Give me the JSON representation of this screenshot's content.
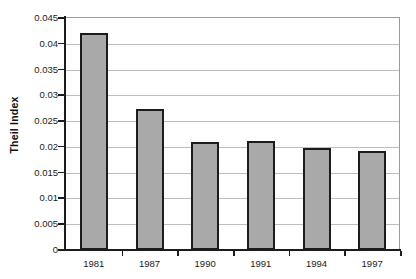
{
  "chart_data": {
    "type": "bar",
    "title": "",
    "subtitle": "",
    "xlabel": "",
    "ylabel": "Theil Index",
    "categories": [
      "1981",
      "1987",
      "1990",
      "1991",
      "1994",
      "1997"
    ],
    "values": [
      0.0421,
      0.0273,
      0.021,
      0.0211,
      0.0198,
      0.0192
    ],
    "series": [
      {
        "name": "Theil Index",
        "values": [
          0.0421,
          0.0273,
          0.021,
          0.0211,
          0.0198,
          0.0192
        ]
      }
    ],
    "ylim": [
      0,
      0.045
    ],
    "ytick_labels": [
      "0",
      "0.005",
      "0.01",
      "0.015",
      "0.02",
      "0.025",
      "0.03",
      "0.035",
      "0.04",
      "0.045"
    ],
    "ytick_values": [
      0,
      0.005,
      0.01,
      0.015,
      0.02,
      0.025,
      0.03,
      0.035,
      0.04,
      0.045
    ],
    "grid": true,
    "grid_axis": "y",
    "legend": false,
    "legend_position": "none",
    "bar_fill_color": "#a9a9a9",
    "bar_border_color": "#1c1c1c",
    "gridline_color": "#bdbdbd",
    "axis_color": "#1c1c1c",
    "background_color": "#ffffff",
    "annotations": []
  }
}
